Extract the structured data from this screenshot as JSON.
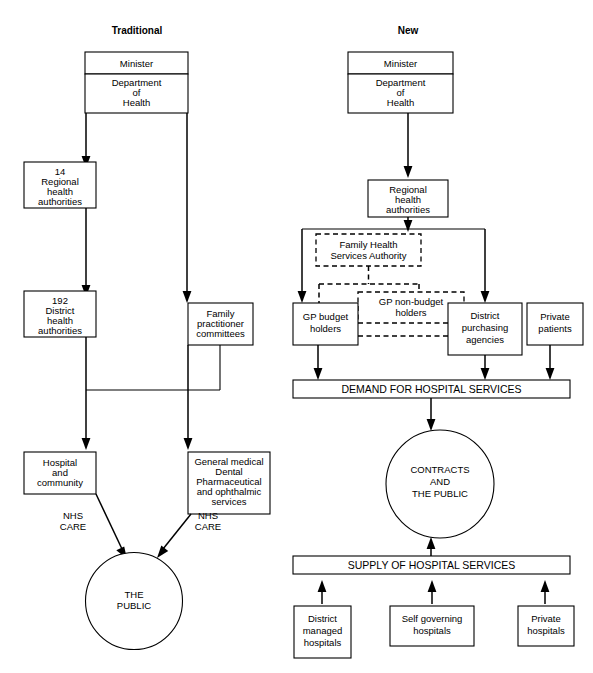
{
  "panels": {
    "left": {
      "title": "Traditional",
      "nodes": {
        "minister": "Minister",
        "dept_l1": "Department",
        "dept_l2": "of",
        "dept_l3": "Health",
        "rha_l1": "14",
        "rha_l2": "Regional",
        "rha_l3": "health",
        "rha_l4": "authorities",
        "dha_l1": "192",
        "dha_l2": "District",
        "dha_l3": "health",
        "dha_l4": "authorities",
        "fpc_l1": "Family",
        "fpc_l2": "practitioner",
        "fpc_l3": "committees",
        "hosp_l1": "Hospital",
        "hosp_l2": "and",
        "hosp_l3": "community",
        "gms_l1": "General medical",
        "gms_l2": "Dental",
        "gms_l3": "Pharmaceutical",
        "gms_l4": "and ophthalmic",
        "gms_l5": "services",
        "public_l1": "THE",
        "public_l2": "PUBLIC"
      },
      "edges": {
        "nhs_care_left_l1": "NHS",
        "nhs_care_left_l2": "CARE",
        "nhs_care_right_l1": "NHS",
        "nhs_care_right_l2": "CARE"
      }
    },
    "right": {
      "title": "New",
      "nodes": {
        "minister": "Minister",
        "dept_l1": "Department",
        "dept_l2": "of",
        "dept_l3": "Health",
        "rha_l1": "Regional",
        "rha_l2": "health",
        "rha_l3": "authorities",
        "fhsa_l1": "Family Health",
        "fhsa_l2": "Services Authority",
        "gp_budget_l1": "GP budget",
        "gp_budget_l2": "holders",
        "gp_nonbudget_l1": "GP non-budget",
        "gp_nonbudget_l2": "holders",
        "dpa_l1": "District",
        "dpa_l2": "purchasing",
        "dpa_l3": "agencies",
        "private_patients_l1": "Private",
        "private_patients_l2": "patients",
        "demand_bar": "DEMAND FOR HOSPITAL SERVICES",
        "contracts_l1": "CONTRACTS",
        "contracts_l2": "AND",
        "contracts_l3": "THE PUBLIC",
        "supply_bar": "SUPPLY OF HOSPITAL SERVICES",
        "district_managed_l1": "District",
        "district_managed_l2": "managed",
        "district_managed_l3": "hospitals",
        "self_governing_l1": "Self governing",
        "self_governing_l2": "hospitals",
        "private_hospitals_l1": "Private",
        "private_hospitals_l2": "hospitals"
      }
    }
  },
  "colors": {
    "stroke": "#000000",
    "fill": "#ffffff",
    "text": "#000000"
  }
}
